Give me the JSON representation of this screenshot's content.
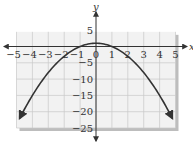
{
  "chart_data": {
    "type": "line",
    "title": "",
    "xlabel": "x",
    "ylabel": "y",
    "xlim": [
      -5,
      5
    ],
    "ylim": [
      -25,
      5
    ],
    "grid": true,
    "x_ticks": [
      "-5",
      "-4",
      "-3",
      "-2",
      "-1",
      "0",
      "1",
      "2",
      "3",
      "4",
      "5"
    ],
    "y_ticks": [
      "5",
      "-5",
      "-10",
      "-15",
      "-20",
      "-25"
    ],
    "series": [
      {
        "name": "parabola",
        "equation": "y = 1 - x^2",
        "x": [
          -4.8,
          -4,
          -3,
          -2,
          -1,
          0,
          1,
          2,
          3,
          4,
          4.8
        ],
        "y": [
          -22,
          -15,
          -8,
          -3,
          0,
          1,
          0,
          -3,
          -8,
          -15,
          -22
        ],
        "arrows_at_ends": true
      }
    ],
    "colors": {
      "grid_bg": "#f2f2f2",
      "grid_lines": "#c8c8c8",
      "shadow": "#bdbdbd",
      "curve": "#333333",
      "axes": "#333333"
    }
  }
}
